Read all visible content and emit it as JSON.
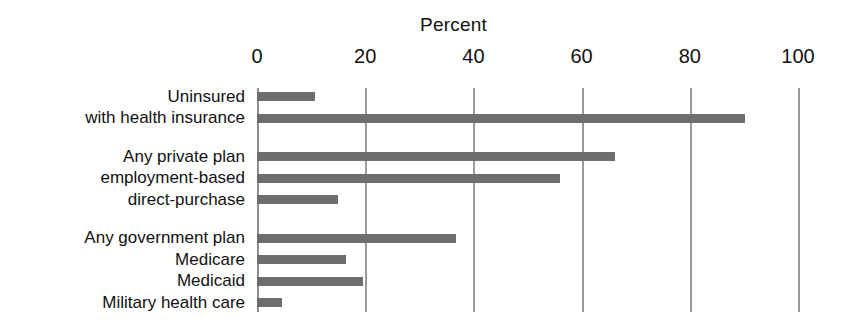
{
  "chart_data": {
    "type": "bar",
    "orientation": "horizontal",
    "title": "Percent",
    "xlabel": "",
    "ylabel": "",
    "xlim": [
      0,
      100
    ],
    "xticks": [
      0,
      20,
      40,
      60,
      80,
      100
    ],
    "xtick_labels": [
      "0",
      "20",
      "40",
      "60",
      "80",
      "100"
    ],
    "grid": true,
    "legend": "none",
    "bar_color": "#6e6e6e",
    "gridline_color": "#9a9a9a",
    "background_color": "#ffffff",
    "text_color": "#111111",
    "categories": [
      "Uninsured",
      "with health insurance",
      "Any private plan",
      "employment-based",
      "direct-purchase",
      "Any government plan",
      "Medicare",
      "Medicaid",
      "Military health care"
    ],
    "values": [
      10.7,
      90.2,
      66.2,
      56.0,
      15.0,
      36.8,
      16.5,
      19.6,
      4.6
    ],
    "bars": [
      {
        "label": "Uninsured",
        "value": 10.7,
        "group": 1
      },
      {
        "label": "with health insurance",
        "value": 90.2,
        "group": 1
      },
      {
        "label": "Any private plan",
        "value": 66.2,
        "group": 2
      },
      {
        "label": "employment-based",
        "value": 56.0,
        "group": 2
      },
      {
        "label": "direct-purchase",
        "value": 15.0,
        "group": 2
      },
      {
        "label": "Any government plan",
        "value": 36.8,
        "group": 3
      },
      {
        "label": "Medicare",
        "value": 16.5,
        "group": 3
      },
      {
        "label": "Medicaid",
        "value": 19.6,
        "group": 3
      },
      {
        "label": "Military health care",
        "value": 4.6,
        "group": 3
      }
    ]
  }
}
